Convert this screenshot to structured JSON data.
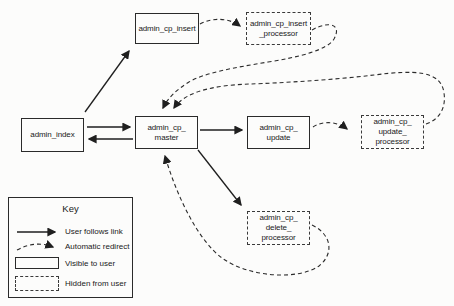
{
  "diagram": {
    "nodes": [
      {
        "id": "admin_index",
        "lines": [
          "admin_index"
        ],
        "visibility": "visible-to-user"
      },
      {
        "id": "admin_cp_insert",
        "lines": [
          "admin_cp_insert"
        ],
        "visibility": "visible-to-user"
      },
      {
        "id": "admin_cp_insert_processor",
        "lines": [
          "admin_cp_insert",
          "_processor"
        ],
        "visibility": "hidden-from-user"
      },
      {
        "id": "admin_cp_master",
        "lines": [
          "admin_cp_",
          "master"
        ],
        "visibility": "visible-to-user"
      },
      {
        "id": "admin_cp_update",
        "lines": [
          "admin_cp_",
          "update"
        ],
        "visibility": "visible-to-user"
      },
      {
        "id": "admin_cp_update_processor",
        "lines": [
          "admin_cp_",
          "update_",
          "processor"
        ],
        "visibility": "hidden-from-user"
      },
      {
        "id": "admin_cp_delete_processor",
        "lines": [
          "admin_cp_",
          "delete_",
          "processor"
        ],
        "visibility": "hidden-from-user"
      }
    ],
    "edges": [
      {
        "from": "admin_index",
        "to": "admin_cp_insert",
        "type": "user-follows-link"
      },
      {
        "from": "admin_index",
        "to": "admin_cp_master",
        "type": "user-follows-link"
      },
      {
        "from": "admin_cp_master",
        "to": "admin_index",
        "type": "user-follows-link"
      },
      {
        "from": "admin_cp_master",
        "to": "admin_cp_update",
        "type": "user-follows-link"
      },
      {
        "from": "admin_cp_master",
        "to": "admin_cp_delete_processor",
        "type": "user-follows-link"
      },
      {
        "from": "admin_cp_insert",
        "to": "admin_cp_insert_processor",
        "type": "automatic-redirect"
      },
      {
        "from": "admin_cp_insert_processor",
        "to": "admin_cp_master",
        "type": "automatic-redirect"
      },
      {
        "from": "admin_cp_update",
        "to": "admin_cp_update_processor",
        "type": "automatic-redirect"
      },
      {
        "from": "admin_cp_update_processor",
        "to": "admin_cp_master",
        "type": "automatic-redirect"
      },
      {
        "from": "admin_cp_delete_processor",
        "to": "admin_cp_master",
        "type": "automatic-redirect"
      }
    ]
  },
  "key": {
    "title": "Key",
    "items": [
      {
        "symbol": "solid-arrow",
        "label": "User follows link"
      },
      {
        "symbol": "dashed-arrow",
        "label": "Automatic redirect"
      },
      {
        "symbol": "solid-box",
        "label": "Visible to user"
      },
      {
        "symbol": "dashed-box",
        "label": "Hidden from user"
      }
    ]
  },
  "colors": {
    "ink": "#1a1a1a",
    "background": "#fcfcfb"
  }
}
